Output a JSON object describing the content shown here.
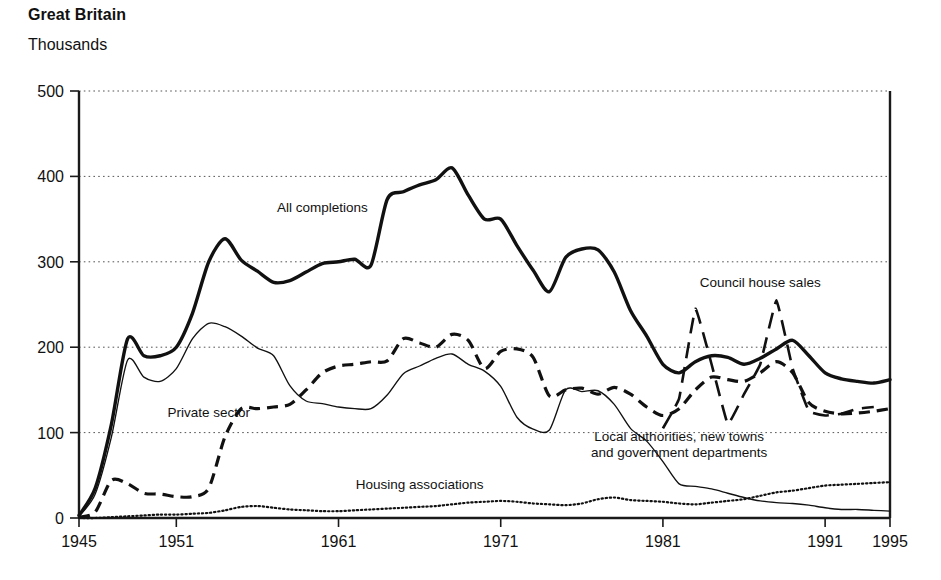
{
  "header": {
    "title": "Great Britain",
    "subtitle": "Thousands"
  },
  "chart_data": {
    "type": "line",
    "title": "Great Britain",
    "subtitle": "Thousands",
    "xlabel": "",
    "ylabel": "Thousands",
    "xlim": [
      1945,
      1995
    ],
    "ylim": [
      0,
      500
    ],
    "yticks": [
      0,
      100,
      200,
      300,
      400,
      500
    ],
    "xticks": [
      1945,
      1951,
      1961,
      1971,
      1981,
      1991,
      1995
    ],
    "grid": true,
    "legend_position": "inline-annotations",
    "x": [
      1945,
      1946,
      1947,
      1948,
      1949,
      1950,
      1951,
      1952,
      1953,
      1954,
      1955,
      1956,
      1957,
      1958,
      1959,
      1960,
      1961,
      1962,
      1963,
      1964,
      1965,
      1966,
      1967,
      1968,
      1969,
      1970,
      1971,
      1972,
      1973,
      1974,
      1975,
      1976,
      1977,
      1978,
      1979,
      1980,
      1981,
      1982,
      1983,
      1984,
      1985,
      1986,
      1987,
      1988,
      1989,
      1990,
      1991,
      1992,
      1993,
      1994,
      1995
    ],
    "series": [
      {
        "name": "All completions",
        "style": "thick-solid",
        "label_x": 1960,
        "label_y": 358,
        "values": [
          3,
          35,
          110,
          210,
          190,
          190,
          200,
          240,
          300,
          327,
          302,
          289,
          276,
          278,
          288,
          298,
          300,
          303,
          296,
          373,
          382,
          390,
          396,
          410,
          378,
          350,
          350,
          319,
          290,
          265,
          305,
          315,
          314,
          288,
          243,
          213,
          180,
          170,
          183,
          190,
          188,
          180,
          187,
          198,
          208,
          190,
          170,
          163,
          160,
          158,
          162
        ]
      },
      {
        "name": "Local authorities, new towns and government departments",
        "style": "thin-solid",
        "label_x": 1982,
        "label_y": 78,
        "values": [
          2,
          28,
          95,
          185,
          165,
          160,
          175,
          210,
          228,
          224,
          213,
          199,
          190,
          155,
          137,
          134,
          130,
          128,
          128,
          144,
          169,
          178,
          187,
          192,
          180,
          172,
          154,
          118,
          104,
          103,
          150,
          148,
          149,
          133,
          105,
          90,
          66,
          40,
          37,
          34,
          29,
          24,
          20,
          18,
          17,
          15,
          12,
          10,
          10,
          9,
          8
        ]
      },
      {
        "name": "Private sector",
        "style": "dashed",
        "label_x": 1953,
        "label_y": 118,
        "values": [
          1,
          7,
          44,
          40,
          29,
          28,
          25,
          25,
          35,
          95,
          128,
          128,
          130,
          133,
          150,
          170,
          178,
          180,
          183,
          184,
          210,
          205,
          200,
          215,
          208,
          175,
          195,
          198,
          188,
          143,
          150,
          152,
          145,
          153,
          145,
          130,
          120,
          128,
          150,
          165,
          162,
          160,
          170,
          183,
          170,
          135,
          125,
          122,
          123,
          125,
          128
        ]
      },
      {
        "name": "Council house sales",
        "style": "long-dashed",
        "label_x": 1987,
        "label_y": 270,
        "values": [
          null,
          null,
          null,
          null,
          null,
          null,
          null,
          null,
          null,
          null,
          null,
          null,
          null,
          null,
          null,
          null,
          null,
          null,
          null,
          null,
          null,
          null,
          null,
          null,
          null,
          null,
          null,
          null,
          null,
          null,
          null,
          null,
          null,
          null,
          null,
          null,
          105,
          140,
          245,
          180,
          110,
          145,
          180,
          255,
          175,
          125,
          120,
          122,
          128,
          130,
          null
        ]
      },
      {
        "name": "Housing associations",
        "style": "dotted",
        "label_x": 1966,
        "label_y": 34,
        "values": [
          0,
          0,
          1,
          2,
          3,
          4,
          4,
          5,
          6,
          9,
          13,
          14,
          12,
          10,
          9,
          8,
          8,
          9,
          10,
          11,
          12,
          13,
          14,
          16,
          18,
          19,
          20,
          19,
          17,
          16,
          15,
          17,
          22,
          24,
          21,
          20,
          19,
          17,
          16,
          18,
          20,
          22,
          26,
          30,
          32,
          35,
          38,
          39,
          40,
          41,
          42
        ]
      }
    ],
    "annotations": [
      {
        "text": "All completions",
        "x": 1960,
        "y": 358
      },
      {
        "text": "Private sector",
        "x": 1953,
        "y": 118
      },
      {
        "text": "Council house sales",
        "x": 1987,
        "y": 270
      },
      {
        "text": "Local authorities, new towns",
        "x": 1982,
        "y": 90
      },
      {
        "text": "and government departments",
        "x": 1982,
        "y": 72
      },
      {
        "text": "Housing  associations",
        "x": 1966,
        "y": 34
      }
    ]
  }
}
